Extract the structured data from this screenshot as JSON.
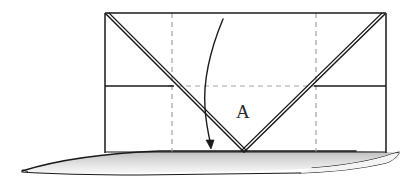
{
  "figure": {
    "type": "geometric-line-diagram",
    "title": "",
    "background_color": "#ffffff",
    "stroke_color": "#1a1a1a",
    "dashed_color": "#9a9a9a",
    "shadow_fill_top": "#c9c9c9",
    "shadow_fill_bottom": "#f2f2f2",
    "labels": [
      {
        "id": "vertex-label",
        "text": "A",
        "x": 236,
        "y": 102,
        "font_size": 19
      }
    ],
    "panel": {
      "left": 105,
      "right": 386,
      "top": 13,
      "bottom": 153,
      "horizontal_divider_y": 86
    },
    "dashed_vertical_lines_x": [
      172,
      316
    ],
    "dashed_horizontal_y": 86,
    "fold_vertex": {
      "x": 244,
      "y": 152
    },
    "curve_start": {
      "x": 223,
      "y": 19
    },
    "curve_end": {
      "x": 211,
      "y": 146
    },
    "arrow_tip": {
      "x": 210,
      "y": 148
    },
    "ground_plane": {
      "left_tip_x": 22,
      "right_tip_x": 399,
      "top_y": 151,
      "bottom_y": 174
    }
  }
}
